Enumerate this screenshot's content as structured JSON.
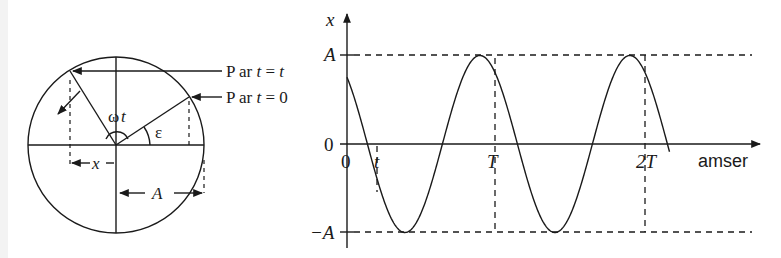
{
  "phasor": {
    "label_p_t": "P ar t = t",
    "label_p_t_parts": {
      "prefix": "P ar ",
      "var": "t",
      "eq": " = ",
      "val": "t"
    },
    "label_p_0_parts": {
      "prefix": "P ar ",
      "var": "t",
      "eq": " = ",
      "val": "0"
    },
    "label_p_0": "P ar t = 0",
    "angle_omega": "ω",
    "angle_t": "t",
    "angle_epsilon": "ε",
    "proj_label": "x",
    "radius_label": "A"
  },
  "graph": {
    "y_axis_label": "x",
    "x_axis_label": "amser",
    "y_ticks": {
      "top": "A",
      "zero": "0",
      "bottom": "−A"
    },
    "x_ticks": {
      "origin": "0",
      "t": "t",
      "T": "T",
      "2T": "2T"
    }
  },
  "chart_data": {
    "type": "line",
    "title": "",
    "xlabel": "amser",
    "ylabel": "x",
    "x_ticks": [
      "0",
      "t",
      "T",
      "2T"
    ],
    "y_ticks": [
      "−A",
      "0",
      "A"
    ],
    "amplitude": "A",
    "phase_epsilon_approx_deg": 41,
    "x_range_periods": [
      0,
      2.15
    ],
    "reference_lines": [
      "x = A (dashed)",
      "x = −A (dashed)",
      "vertical at T (dashed)",
      "vertical at 2T (dashed)",
      "vertical at t (dashed)"
    ],
    "grid": false
  }
}
